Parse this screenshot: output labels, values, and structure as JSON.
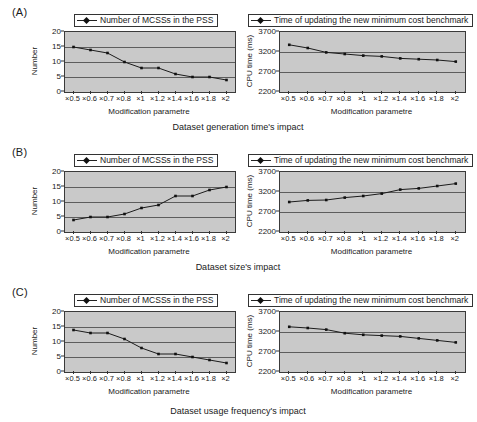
{
  "figure": {
    "panels": [
      {
        "tag": "(A)",
        "caption": "Dataset generation time's impact",
        "left": {
          "legend": "Number of MCSSs in the PSS",
          "ylabel": "Number",
          "xlabel": "Modification parametre"
        },
        "right": {
          "legend": "Time of updating the new minimum cost benchmark",
          "ylabel": "CPU time (ms)",
          "xlabel": "Modification parametre"
        }
      },
      {
        "tag": "(B)",
        "caption": "Dataset size's impact",
        "left": {
          "legend": "Number of MCSSs in the PSS",
          "ylabel": "Number",
          "xlabel": "Modification parametre"
        },
        "right": {
          "legend": "Time of updating the new minimum cost benchmark",
          "ylabel": "CPU time (ms)",
          "xlabel": "Modification parametre"
        }
      },
      {
        "tag": "(C)",
        "caption": "Dataset usage frequency's impact",
        "left": {
          "legend": "Number of MCSSs in the PSS",
          "ylabel": "Number",
          "xlabel": "Modification parametre"
        },
        "right": {
          "legend": "Time of updating the new minimum cost benchmark",
          "ylabel": "CPU time (ms)",
          "xlabel": "Modification parametre"
        }
      }
    ]
  },
  "chart_data": [
    {
      "id": "A-left",
      "type": "line",
      "title": "Dataset generation time's impact",
      "panel": "(A)",
      "legend": [
        "Number of MCSSs in the PSS"
      ],
      "legend_position": "top",
      "grid": true,
      "xlabel": "Modification parametre",
      "ylabel": "Number",
      "categories": [
        "×0.5",
        "×0.6",
        "×0.7",
        "×0.8",
        "×1",
        "×1.2",
        "×1.4",
        "×1.6",
        "×1.8",
        "×2"
      ],
      "values": [
        15,
        14,
        13,
        10,
        8,
        8,
        6,
        5,
        5,
        4
      ],
      "ylim": [
        0,
        20
      ],
      "yticks": [
        0,
        5,
        10,
        15,
        20
      ]
    },
    {
      "id": "A-right",
      "type": "line",
      "title": "Dataset generation time's impact",
      "panel": "(A)",
      "legend": [
        "Time of updating the new minimum cost benchmark"
      ],
      "legend_position": "top",
      "grid": true,
      "xlabel": "Modification parametre",
      "ylabel": "CPU time (ms)",
      "categories": [
        "×0.5",
        "×0.6",
        "×0.7",
        "×0.8",
        "×1",
        "×1.2",
        "×1.4",
        "×1.6",
        "×1.8",
        "×2"
      ],
      "values": [
        3380,
        3300,
        3190,
        3150,
        3110,
        3090,
        3040,
        3020,
        3000,
        2960
      ],
      "ylim": [
        2200,
        3700
      ],
      "yticks": [
        2200,
        2700,
        3200,
        3700
      ]
    },
    {
      "id": "B-left",
      "type": "line",
      "title": "Dataset size's impact",
      "panel": "(B)",
      "legend": [
        "Number of MCSSs in the PSS"
      ],
      "legend_position": "top",
      "grid": true,
      "xlabel": "Modification parametre",
      "ylabel": "Number",
      "categories": [
        "×0.5",
        "×0.6",
        "×0.7",
        "×0.8",
        "×1",
        "×1.2",
        "×1.4",
        "×1.6",
        "×1.8",
        "×2"
      ],
      "values": [
        4,
        5,
        5,
        6,
        8,
        9,
        12,
        12,
        14,
        15
      ],
      "ylim": [
        0,
        20
      ],
      "yticks": [
        0,
        5,
        10,
        15,
        20
      ]
    },
    {
      "id": "B-right",
      "type": "line",
      "title": "Dataset size's impact",
      "panel": "(B)",
      "legend": [
        "Time of updating the new minimum cost benchmark"
      ],
      "legend_position": "top",
      "grid": true,
      "xlabel": "Modification parametre",
      "ylabel": "CPU time (ms)",
      "categories": [
        "×0.5",
        "×0.6",
        "×0.7",
        "×0.8",
        "×1",
        "×1.2",
        "×1.4",
        "×1.6",
        "×1.8",
        "×2"
      ],
      "values": [
        2950,
        2990,
        3000,
        3060,
        3100,
        3160,
        3260,
        3290,
        3350,
        3410
      ],
      "ylim": [
        2200,
        3700
      ],
      "yticks": [
        2200,
        2700,
        3200,
        3700
      ]
    },
    {
      "id": "C-left",
      "type": "line",
      "title": "Dataset usage frequency's impact",
      "panel": "(C)",
      "legend": [
        "Number of MCSSs in the PSS"
      ],
      "legend_position": "top",
      "grid": true,
      "xlabel": "Modification parametre",
      "ylabel": "Number",
      "categories": [
        "×0.5",
        "×0.6",
        "×0.7",
        "×0.8",
        "×1",
        "×1.2",
        "×1.4",
        "×1.6",
        "×1.8",
        "×2"
      ],
      "values": [
        14,
        13,
        13,
        11,
        8,
        6,
        6,
        5,
        4,
        3
      ],
      "ylim": [
        0,
        20
      ],
      "yticks": [
        0,
        5,
        10,
        15,
        20
      ]
    },
    {
      "id": "C-right",
      "type": "line",
      "title": "Dataset usage frequency's impact",
      "panel": "(C)",
      "legend": [
        "Time of updating the new minimum cost benchmark"
      ],
      "legend_position": "top",
      "grid": true,
      "xlabel": "Modification parametre",
      "ylabel": "CPU time (ms)",
      "categories": [
        "×0.5",
        "×0.6",
        "×0.7",
        "×0.8",
        "×1",
        "×1.2",
        "×1.4",
        "×1.6",
        "×1.8",
        "×2"
      ],
      "values": [
        3330,
        3300,
        3260,
        3170,
        3130,
        3110,
        3090,
        3040,
        2990,
        2940
      ],
      "ylim": [
        2200,
        3700
      ],
      "yticks": [
        2200,
        2700,
        3200,
        3700
      ]
    }
  ]
}
